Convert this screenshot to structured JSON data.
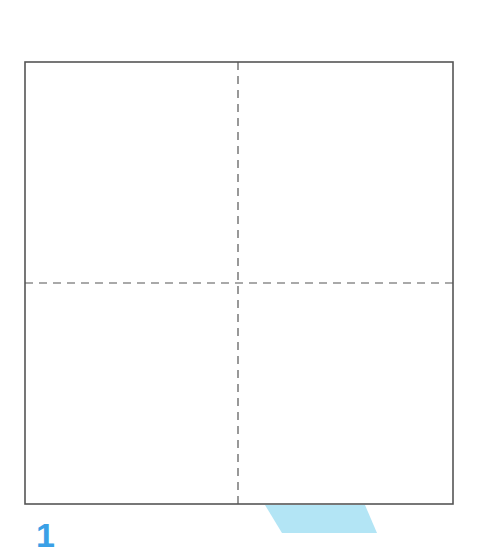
{
  "diagram": {
    "square": {
      "x": 25,
      "y": 62,
      "width": 428,
      "height": 442,
      "stroke": "#555555",
      "stroke_width": 1.6
    },
    "dashed_lines": {
      "vertical_x": 238,
      "horizontal_y": 283,
      "stroke": "#555555",
      "dash": "8,6"
    },
    "quadrants": [
      "top-left",
      "top-right",
      "bottom-left",
      "bottom-right"
    ],
    "accent_shape": {
      "type": "parallelogram",
      "color": "#b3e5f5",
      "points": "265,505 365,505 377,533 282,533"
    },
    "step_number": "1",
    "step_number_color": "#3aa0e6"
  }
}
